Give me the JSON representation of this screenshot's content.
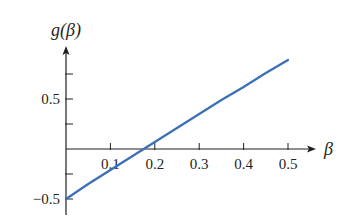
{
  "chart_data": {
    "type": "line",
    "title": "",
    "xlabel": "β",
    "ylabel": "g(β)",
    "xlim": [
      0,
      0.55
    ],
    "ylim": [
      -0.65,
      1.0
    ],
    "grid": false,
    "legend": null,
    "x_ticks": [
      0.1,
      0.2,
      0.3,
      0.4,
      0.5
    ],
    "x_tick_labels": [
      "0.1",
      "0.2",
      "0.3",
      "0.4",
      "0.5"
    ],
    "y_ticks": [
      -0.5,
      -0.25,
      0.25,
      0.5,
      0.75
    ],
    "y_tick_labels": [
      "−0.5",
      "",
      "",
      "0.5",
      ""
    ],
    "series": [
      {
        "name": "g(β)",
        "color": "#3a6fb8",
        "x": [
          0,
          0.05,
          0.1,
          0.15,
          0.2,
          0.25,
          0.3,
          0.35,
          0.4,
          0.45,
          0.5
        ],
        "y": [
          -0.5,
          -0.35,
          -0.21,
          -0.07,
          0.07,
          0.21,
          0.35,
          0.49,
          0.62,
          0.76,
          0.89
        ]
      }
    ]
  },
  "labels": {
    "y_axis": "g(β)",
    "x_axis": "β"
  }
}
